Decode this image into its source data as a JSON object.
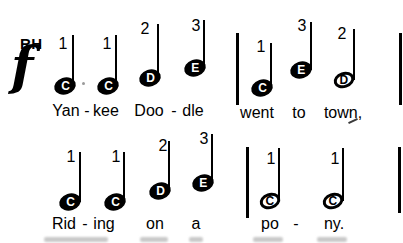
{
  "colors": {
    "ink": "#000000",
    "background": "#ffffff"
  },
  "header": {
    "hand": "RH",
    "dynamic": "f"
  },
  "staffLines": [
    {
      "id": "line-1",
      "notes": [
        {
          "letter": "C",
          "finger": "1",
          "type": "quarter",
          "cx": 65,
          "cy": 86,
          "stemX": 73,
          "stemTop": 35,
          "fingerX": 63,
          "fingerY": 44
        },
        {
          "letter": "C",
          "finger": "1",
          "type": "quarter",
          "cx": 108,
          "cy": 86,
          "stemX": 116,
          "stemTop": 35,
          "fingerX": 107,
          "fingerY": 44
        },
        {
          "letter": "D",
          "finger": "2",
          "type": "quarter",
          "cx": 150,
          "cy": 78,
          "stemX": 158,
          "stemTop": 24,
          "fingerX": 145,
          "fingerY": 29
        },
        {
          "letter": "E",
          "finger": "3",
          "type": "quarter",
          "cx": 195,
          "cy": 68,
          "stemX": 204,
          "stemTop": 20,
          "fingerX": 196,
          "fingerY": 26
        },
        {
          "letter": "C",
          "finger": "1",
          "type": "quarter",
          "cx": 262,
          "cy": 88,
          "stemX": 271,
          "stemTop": 43,
          "fingerX": 261,
          "fingerY": 47
        },
        {
          "letter": "E",
          "finger": "3",
          "type": "quarter",
          "cx": 301,
          "cy": 70,
          "stemX": 311,
          "stemTop": 22,
          "fingerX": 302,
          "fingerY": 26
        },
        {
          "letter": "D",
          "finger": "2",
          "type": "half",
          "cx": 344,
          "cy": 80,
          "stemX": 354,
          "stemTop": 29,
          "fingerX": 342,
          "fingerY": 34
        }
      ],
      "barlines": [
        {
          "x": 237,
          "top": 33,
          "bottom": 105
        },
        {
          "x": 400,
          "top": 33,
          "bottom": 105
        }
      ],
      "lyrics": [
        {
          "text": "Yan",
          "x": 66,
          "y": 111
        },
        {
          "text": "-",
          "x": 87,
          "y": 111
        },
        {
          "text": "kee",
          "x": 106,
          "y": 111
        },
        {
          "text": "Doo",
          "x": 149,
          "y": 111
        },
        {
          "text": "-",
          "x": 174,
          "y": 111
        },
        {
          "text": "dle",
          "x": 193,
          "y": 111
        },
        {
          "text": "went",
          "x": 257,
          "y": 113
        },
        {
          "text": "to",
          "x": 299,
          "y": 113
        },
        {
          "text": "town,",
          "x": 343,
          "y": 113
        }
      ]
    },
    {
      "id": "line-2",
      "notes": [
        {
          "letter": "C",
          "finger": "1",
          "type": "quarter",
          "cx": 70,
          "cy": 202,
          "stemX": 80,
          "stemTop": 152,
          "fingerX": 71,
          "fingerY": 157
        },
        {
          "letter": "C",
          "finger": "1",
          "type": "quarter",
          "cx": 115,
          "cy": 202,
          "stemX": 124,
          "stemTop": 152,
          "fingerX": 116,
          "fingerY": 157
        },
        {
          "letter": "D",
          "finger": "2",
          "type": "quarter",
          "cx": 160,
          "cy": 191,
          "stemX": 169,
          "stemTop": 141,
          "fingerX": 163,
          "fingerY": 146
        },
        {
          "letter": "E",
          "finger": "3",
          "type": "quarter",
          "cx": 203,
          "cy": 183,
          "stemX": 212,
          "stemTop": 134,
          "fingerX": 204,
          "fingerY": 139
        },
        {
          "letter": "C",
          "finger": "1",
          "type": "half",
          "cx": 270,
          "cy": 201,
          "stemX": 279,
          "stemTop": 148,
          "fingerX": 271,
          "fingerY": 159
        },
        {
          "letter": "C",
          "finger": "1",
          "type": "half",
          "cx": 333,
          "cy": 201,
          "stemX": 343,
          "stemTop": 148,
          "fingerX": 335,
          "fingerY": 159
        }
      ],
      "barlines": [
        {
          "x": 247,
          "top": 147,
          "bottom": 218
        },
        {
          "x": 399,
          "top": 147,
          "bottom": 213
        }
      ],
      "lyrics": [
        {
          "text": "Rid",
          "x": 64,
          "y": 224
        },
        {
          "text": "-",
          "x": 85,
          "y": 224
        },
        {
          "text": "ing",
          "x": 104,
          "y": 224
        },
        {
          "text": "on",
          "x": 155,
          "y": 224
        },
        {
          "text": "a",
          "x": 196,
          "y": 224
        },
        {
          "text": "po",
          "x": 270,
          "y": 224
        },
        {
          "text": "-",
          "x": 296,
          "y": 224
        },
        {
          "text": "ny.",
          "x": 334,
          "y": 224
        }
      ]
    }
  ],
  "artifacts": {
    "stray_mark": {
      "x": 348,
      "y": 120
    },
    "ink_dot": {
      "x": 82,
      "y": 82
    },
    "bottom_smudges": [
      {
        "x": 44,
        "w": 64
      },
      {
        "x": 140,
        "w": 28
      },
      {
        "x": 189,
        "w": 14
      },
      {
        "x": 253,
        "w": 30
      },
      {
        "x": 317,
        "w": 30
      }
    ]
  }
}
